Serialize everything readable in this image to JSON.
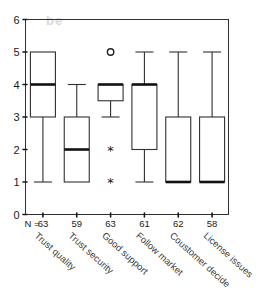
{
  "chart_data": {
    "type": "box",
    "title": "",
    "xlabel": "",
    "ylabel": "",
    "ylim": [
      0,
      6
    ],
    "ytick_labels": [
      "0",
      "1",
      "2",
      "3",
      "4",
      "5",
      "6"
    ],
    "yticks": [
      0,
      1,
      2,
      3,
      4,
      5,
      6
    ],
    "grid": false,
    "legend": "none",
    "n_row_label": "N =",
    "categories": [
      "Trust quality",
      "Trust security",
      "Good support",
      "Follow market",
      "Coustomer decide",
      "License issues"
    ],
    "n_values": [
      63,
      59,
      63,
      61,
      62,
      58
    ],
    "boxes": [
      {
        "category": "Trust quality",
        "n": 63,
        "whisker_low": 1,
        "q1": 3,
        "median": 4,
        "q3": 5,
        "whisker_high": 5,
        "outliers": [],
        "extremes": []
      },
      {
        "category": "Trust security",
        "n": 59,
        "whisker_low": 1,
        "q1": 1,
        "median": 2,
        "q3": 3,
        "whisker_high": 4,
        "outliers": [],
        "extremes": []
      },
      {
        "category": "Good support",
        "n": 63,
        "whisker_low": 3,
        "q1": 3.5,
        "median": 4,
        "q3": 4,
        "whisker_high": 4,
        "outliers": [
          5
        ],
        "extremes": [
          2,
          1
        ]
      },
      {
        "category": "Follow market",
        "n": 61,
        "whisker_low": 1,
        "q1": 2,
        "median": 4,
        "q3": 4,
        "whisker_high": 5,
        "outliers": [],
        "extremes": []
      },
      {
        "category": "Coustomer decide",
        "n": 62,
        "whisker_low": 1,
        "q1": 1,
        "median": 1,
        "q3": 3,
        "whisker_high": 5,
        "outliers": [],
        "extremes": []
      },
      {
        "category": "License issues",
        "n": 58,
        "whisker_low": 1,
        "q1": 1,
        "median": 1,
        "q3": 3,
        "whisker_high": 5,
        "outliers": [],
        "extremes": []
      }
    ],
    "colors": {
      "box_stroke": "#303030",
      "median_stroke": "#111111",
      "frame_stroke": "#303030",
      "background": "#ffffff",
      "text": "#1a1a1a"
    },
    "outlier_symbol": "o",
    "extreme_symbol": "*"
  },
  "background_bleed": {
    "line1": "be"
  }
}
